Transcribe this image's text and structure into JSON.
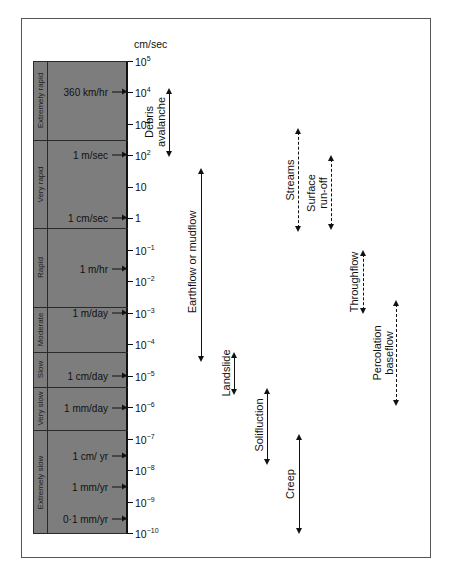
{
  "chart": {
    "axis_unit": "cm/sec",
    "ticks": [
      {
        "exp": "5",
        "base": "10",
        "y": 61
      },
      {
        "exp": "4",
        "base": "10",
        "y": 92
      },
      {
        "exp": "3",
        "base": "10",
        "y": 124
      },
      {
        "exp": "2",
        "base": "10",
        "y": 155
      },
      {
        "exp": "",
        "base": "10",
        "y": 187
      },
      {
        "exp": "",
        "base": "1",
        "y": 218
      },
      {
        "exp": "−1",
        "base": "10",
        "y": 250
      },
      {
        "exp": "−2",
        "base": "10",
        "y": 281
      },
      {
        "exp": "−3",
        "base": "10",
        "y": 313
      },
      {
        "exp": "−4",
        "base": "10",
        "y": 344
      },
      {
        "exp": "−5",
        "base": "10",
        "y": 376
      },
      {
        "exp": "−6",
        "base": "10",
        "y": 407
      },
      {
        "exp": "−7",
        "base": "10",
        "y": 439
      },
      {
        "exp": "−8",
        "base": "10",
        "y": 470
      },
      {
        "exp": "−9",
        "base": "10",
        "y": 502
      },
      {
        "exp": "−10",
        "base": "10",
        "y": 533
      }
    ],
    "bands": [
      {
        "label": "Extremely rapid",
        "top": 61,
        "bottom": 140
      },
      {
        "label": "Very rapid",
        "top": 140,
        "bottom": 228
      },
      {
        "label": "Rapid",
        "top": 228,
        "bottom": 307
      },
      {
        "label": "Moderate",
        "top": 307,
        "bottom": 352
      },
      {
        "label": "Slow",
        "top": 352,
        "bottom": 387
      },
      {
        "label": "Very slow",
        "top": 387,
        "bottom": 430
      },
      {
        "label": "Extremely slow",
        "top": 430,
        "bottom": 534
      }
    ],
    "speeds": [
      {
        "label": "360 km/hr",
        "y": 92
      },
      {
        "label": "1 m/sec",
        "y": 155
      },
      {
        "label": "1 cm/sec",
        "y": 218
      },
      {
        "label": "1 m/hr",
        "y": 269
      },
      {
        "label": "1 m/day",
        "y": 313
      },
      {
        "label": "1 cm/day",
        "y": 376
      },
      {
        "label": "1 mm/day",
        "y": 408
      },
      {
        "label": "1 cm/ yr",
        "y": 456
      },
      {
        "label": "1 mm/yr",
        "y": 487
      },
      {
        "label": "0·1 mm/yr",
        "y": 519
      }
    ],
    "processes": [
      {
        "lines": [
          "Debris",
          "avalanche"
        ],
        "x": 169,
        "top": 88,
        "bottom": 157,
        "style": "solid",
        "label_x": 155,
        "label_y": 122
      },
      {
        "lines": [
          "Earthflow or mudflow"
        ],
        "x": 201,
        "top": 168,
        "bottom": 362,
        "style": "solid",
        "label_x": 192,
        "label_y": 262
      },
      {
        "lines": [
          "Landslide"
        ],
        "x": 234,
        "top": 352,
        "bottom": 395,
        "style": "solid",
        "label_x": 226,
        "label_y": 373
      },
      {
        "lines": [
          "Solifluction"
        ],
        "x": 267,
        "top": 388,
        "bottom": 465,
        "style": "solid",
        "label_x": 259,
        "label_y": 425
      },
      {
        "lines": [
          "Creep"
        ],
        "x": 299,
        "top": 434,
        "bottom": 534,
        "style": "solid",
        "label_x": 290,
        "label_y": 484
      },
      {
        "lines": [
          "Streams"
        ],
        "x": 298,
        "top": 128,
        "bottom": 232,
        "style": "dashed",
        "label_x": 290,
        "label_y": 180
      },
      {
        "lines": [
          "Surface",
          "run-off"
        ],
        "x": 331,
        "top": 155,
        "bottom": 230,
        "style": "dashed",
        "label_x": 317,
        "label_y": 193
      },
      {
        "lines": [
          "Throughflow"
        ],
        "x": 363,
        "top": 250,
        "bottom": 314,
        "style": "dashed",
        "label_x": 354,
        "label_y": 282
      },
      {
        "lines": [
          "Percolation",
          "baseflow"
        ],
        "x": 396,
        "top": 300,
        "bottom": 406,
        "style": "dashed",
        "label_x": 383,
        "label_y": 353
      }
    ]
  },
  "chart_data": {
    "type": "table",
    "title": "",
    "ylabel": "cm/sec",
    "y_scale": "log10",
    "ylim": [
      1e-10,
      100000.0
    ],
    "y_tick_labels": [
      "10^5",
      "10^4",
      "10^3",
      "10^2",
      "10",
      "1",
      "10^-1",
      "10^-2",
      "10^-3",
      "10^-4",
      "10^-5",
      "10^-6",
      "10^-7",
      "10^-8",
      "10^-9",
      "10^-10"
    ],
    "velocity_classes": [
      {
        "name": "Extremely rapid",
        "range_cm_s": [
          250.0,
          100000.0
        ]
      },
      {
        "name": "Very rapid",
        "range_cm_s": [
          0.6,
          250.0
        ]
      },
      {
        "name": "Rapid",
        "range_cm_s": [
          0.0015,
          0.6
        ]
      },
      {
        "name": "Moderate",
        "range_cm_s": [
          5e-05,
          0.0015
        ]
      },
      {
        "name": "Slow",
        "range_cm_s": [
          3e-06,
          5e-05
        ]
      },
      {
        "name": "Very slow",
        "range_cm_s": [
          1e-07,
          3e-06
        ]
      },
      {
        "name": "Extremely slow",
        "range_cm_s": [
          1e-10,
          1e-07
        ]
      }
    ],
    "reference_speeds": [
      {
        "label": "360 km/hr",
        "cm_s": 10000.0
      },
      {
        "label": "1 m/sec",
        "cm_s": 100.0
      },
      {
        "label": "1 cm/sec",
        "cm_s": 1
      },
      {
        "label": "1 m/hr",
        "cm_s": 0.028
      },
      {
        "label": "1 m/day",
        "cm_s": 0.001
      },
      {
        "label": "1 cm/day",
        "cm_s": 1e-05
      },
      {
        "label": "1 mm/day",
        "cm_s": 1e-06
      },
      {
        "label": "1 cm/ yr",
        "cm_s": 3e-08
      },
      {
        "label": "1 mm/yr",
        "cm_s": 3e-09
      },
      {
        "label": "0·1 mm/yr",
        "cm_s": 3e-10
      }
    ],
    "series": [
      {
        "name": "Debris avalanche",
        "type": "mass movement",
        "range_cm_s": [
          200.0,
          10000.0
        ]
      },
      {
        "name": "Earthflow or mudflow",
        "type": "mass movement",
        "range_cm_s": [
          2e-05,
          30.0
        ]
      },
      {
        "name": "Landslide",
        "type": "mass movement",
        "range_cm_s": [
          4e-07,
          3e-05
        ]
      },
      {
        "name": "Solifluction",
        "type": "mass movement",
        "range_cm_s": [
          1e-08,
          3e-06
        ]
      },
      {
        "name": "Creep",
        "type": "mass movement",
        "range_cm_s": [
          1e-10,
          1e-07
        ]
      },
      {
        "name": "Streams",
        "type": "water flow",
        "range_cm_s": [
          0.6,
          1000.0
        ]
      },
      {
        "name": "Surface run-off",
        "type": "water flow",
        "range_cm_s": [
          0.7,
          100.0
        ]
      },
      {
        "name": "Throughflow",
        "type": "water flow",
        "range_cm_s": [
          0.001,
          0.1
        ]
      },
      {
        "name": "Percolation baseflow",
        "type": "water flow",
        "range_cm_s": [
          1e-06,
          0.003
        ]
      }
    ]
  }
}
